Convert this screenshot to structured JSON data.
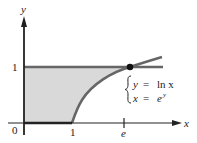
{
  "figure": {
    "axes": {
      "x_label": "x",
      "y_label": "y",
      "origin_label": "0",
      "x_ticks": [
        "1",
        "e"
      ],
      "y_ticks": [
        "1"
      ]
    },
    "equations": {
      "line1_lhs": "y",
      "line1_eq": "=",
      "line1_rhs": "ln x",
      "line2_lhs": "x",
      "line2_eq": "=",
      "line2_rhs": "e",
      "line2_rhs_sup": "y"
    },
    "colors": {
      "shade": "#d9d9d9",
      "curve": "#666666",
      "axis": "#222222",
      "point": "#111111"
    }
  }
}
